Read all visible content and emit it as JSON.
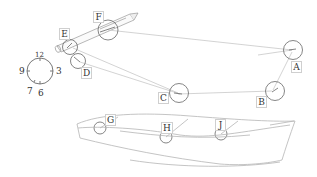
{
  "figure": {
    "stroke_color": "#bdbdbd",
    "circle_color": "#555555",
    "label_color": "#333333"
  },
  "labels": {
    "A": "A",
    "B": "B",
    "C": "C",
    "D": "D",
    "E": "E",
    "F": "F",
    "G": "G",
    "H": "H",
    "J": "J"
  },
  "clock": {
    "twelve": "12",
    "three": "3",
    "six": "6",
    "seven": "7",
    "nine": "9"
  }
}
